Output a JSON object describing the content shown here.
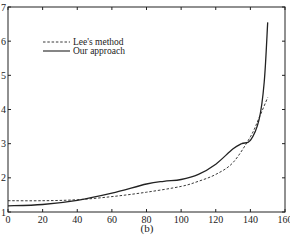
{
  "chart_data": {
    "type": "line",
    "title": "",
    "caption": "(b)",
    "xlabel": "",
    "ylabel": "",
    "xlim": [
      0,
      160
    ],
    "ylim": [
      1,
      7
    ],
    "xticks": [
      0,
      20,
      40,
      60,
      80,
      100,
      120,
      140,
      160
    ],
    "xtick_labels": [
      "0",
      "20",
      "40",
      "60",
      "80",
      "100",
      "120",
      "140",
      "160"
    ],
    "yticks": [
      1,
      2,
      3,
      4,
      5,
      6,
      7
    ],
    "ytick_labels": [
      "1",
      "2",
      "3",
      "4",
      "5",
      "6",
      "7"
    ],
    "grid": false,
    "legend_position": "upper-left-inside",
    "series": [
      {
        "name": "Lee's method",
        "style": "dashed",
        "color": "#222222",
        "x": [
          0,
          20,
          40,
          60,
          80,
          100,
          110,
          120,
          130,
          140,
          145,
          150
        ],
        "y": [
          1.33,
          1.33,
          1.36,
          1.45,
          1.58,
          1.75,
          1.9,
          2.1,
          2.45,
          3.2,
          3.75,
          4.35
        ]
      },
      {
        "name": "Our approach",
        "style": "solid",
        "color": "#222222",
        "x": [
          0,
          20,
          40,
          60,
          80,
          90,
          100,
          110,
          120,
          130,
          135,
          140,
          145,
          148,
          150
        ],
        "y": [
          1.18,
          1.22,
          1.34,
          1.55,
          1.82,
          1.9,
          1.95,
          2.1,
          2.4,
          2.85,
          3.0,
          3.1,
          3.7,
          4.8,
          6.55
        ]
      }
    ]
  }
}
